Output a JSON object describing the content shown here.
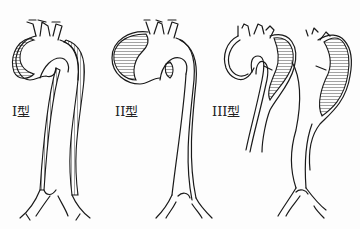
{
  "figure": {
    "panels": [
      {
        "id": "type-1",
        "label": "I型"
      },
      {
        "id": "type-2",
        "label": "II型"
      },
      {
        "id": "type-3",
        "label": "III型"
      }
    ]
  },
  "colors": {
    "ink": "#1a1a1a",
    "background": "#fdfdfd"
  }
}
